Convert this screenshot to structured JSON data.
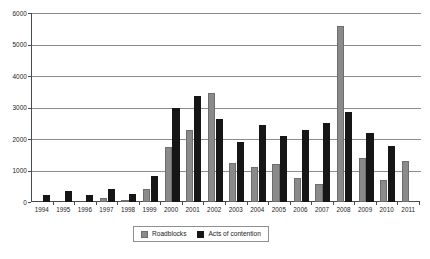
{
  "chart_data": {
    "type": "bar",
    "title": "",
    "subtitle": "",
    "xlabel": "",
    "ylabel": "",
    "ylim": [
      0,
      6000
    ],
    "ytick_step": 1000,
    "yticks": [
      "0",
      "1000",
      "2000",
      "3000",
      "4000",
      "5000",
      "6000"
    ],
    "grid": true,
    "grid_axis": "y",
    "legend_position": "bottom-center",
    "categories": [
      "1994",
      "1995",
      "1996",
      "1997",
      "1998",
      "1999",
      "2000",
      "2001",
      "2002",
      "2003",
      "2004",
      "2005",
      "2006",
      "2007",
      "2008",
      "2009",
      "2010",
      "2011"
    ],
    "series": [
      {
        "name": "Roadblocks",
        "color": "#8a8a8a",
        "values": [
          0,
          0,
          0,
          120,
          60,
          420,
          1750,
          2300,
          3450,
          1250,
          1100,
          1200,
          760,
          560,
          5600,
          1400,
          700,
          1300
        ]
      },
      {
        "name": "Acts of contention",
        "color": "#161616",
        "values": [
          220,
          340,
          230,
          400,
          240,
          830,
          3000,
          3380,
          2650,
          1900,
          2450,
          2100,
          2300,
          2500,
          2850,
          2200,
          1780,
          0
        ]
      }
    ]
  },
  "legend": {
    "entries": [
      {
        "label": "Roadblocks",
        "swatch": "gray-square-swatch"
      },
      {
        "label": "Acts of contention",
        "swatch": "black-square-swatch"
      }
    ]
  },
  "colors": {
    "roadblocks": "#8a8a8a",
    "contention": "#161616",
    "gridline": "#8c8c8c",
    "axis": "#4a4a4a",
    "background": "#ffffff",
    "text": "#1a1a1a"
  }
}
